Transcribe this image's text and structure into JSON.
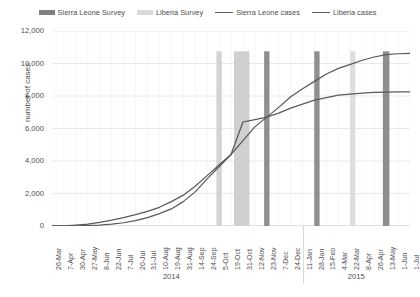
{
  "chart_data": {
    "type": "line",
    "title": "",
    "xlabel": "",
    "ylabel": "number of cases",
    "ylim": [
      0,
      12000
    ],
    "ytick_labels": [
      "12,000",
      "10,000",
      "8,000",
      "6,000",
      "4,000",
      "2,000",
      "0"
    ],
    "ytick_values": [
      12000,
      10000,
      8000,
      6000,
      4000,
      2000,
      0
    ],
    "grid": true,
    "legend_position": "top-center",
    "legend": [
      {
        "label": "Sierra Leone Survey",
        "type": "bar",
        "color": "#808080"
      },
      {
        "label": "Liberia Survey",
        "type": "bar",
        "color": "#d4d4d4"
      },
      {
        "label": "Sierra Leone cases",
        "type": "line",
        "color": "#595959"
      },
      {
        "label": "Liberia cases",
        "type": "line",
        "color": "#595959"
      }
    ],
    "categories": [
      "26-Mar",
      "7-Apr",
      "30-Apr",
      "27-May",
      "8-Jun",
      "22-Jun",
      "7-Jul",
      "20-Jul",
      "31-Jul",
      "10-Aug",
      "19-Aug",
      "31-Aug",
      "14-Sep",
      "24-Sep",
      "5-Oct",
      "19-Oct",
      "31-Oct",
      "12-Nov",
      "23-Nov",
      "7-Dec",
      "24-Dec",
      "11-Jan",
      "28-Jan",
      "15-Feb",
      "4-Mar",
      "22-Mar",
      "8-Apr",
      "26-Apr",
      "13-May",
      "1-Jun",
      "1-Jul"
    ],
    "x_groups": [
      {
        "label": "2014",
        "start_index": 0,
        "end_index": 20
      },
      {
        "label": "2015",
        "start_index": 21,
        "end_index": 30
      }
    ],
    "series": [
      {
        "name": "Sierra Leone cases",
        "color": "#595959",
        "values": [
          2,
          2,
          35,
          50,
          97,
          158,
          305,
          442,
          646,
          783,
          1026,
          1216,
          1620,
          2021,
          2789,
          3706,
          4759,
          5586,
          6317,
          7312,
          9446,
          10124,
          10518,
          11103,
          11466,
          11841,
          12201,
          12440,
          12632,
          12706,
          12839
        ],
        "display_values": [
          0,
          10,
          60,
          110,
          220,
          360,
          520,
          700,
          900,
          1150,
          1500,
          1900,
          2450,
          3100,
          3750,
          4400,
          5250,
          6100,
          6700,
          7300,
          7950,
          8450,
          8900,
          9350,
          9700,
          9950,
          10200,
          10400,
          10550,
          10600,
          10620
        ]
      },
      {
        "name": "Liberia cases",
        "color": "#595959",
        "values": [
          8,
          21,
          13,
          12,
          33,
          51,
          131,
          249,
          468,
          786,
          1082,
          1698,
          2407,
          3022,
          3924,
          4665,
          6535,
          7082,
          7168,
          7687,
          8018,
          8331,
          8622,
          8745,
          8881,
          9238,
          9343,
          9602,
          10042,
          10564,
          10672
        ],
        "display_values": [
          0,
          5,
          15,
          30,
          60,
          110,
          200,
          330,
          520,
          760,
          1050,
          1500,
          2100,
          2900,
          3650,
          4400,
          6400,
          6550,
          6700,
          6950,
          7250,
          7500,
          7750,
          7900,
          8050,
          8120,
          8180,
          8220,
          8240,
          8250,
          8250
        ]
      }
    ],
    "survey_bars": [
      {
        "series": "Liberia Survey",
        "color": "#d4d4d4",
        "center_index": 14.0,
        "width_indices": 0.45,
        "top_value": 10750
      },
      {
        "series": "Liberia Survey",
        "color": "#d0d0d0",
        "center_index": 15.9,
        "width_indices": 1.3,
        "top_value": 10750
      },
      {
        "series": "Sierra Leone Survey",
        "color": "#8f8f8f",
        "center_index": 18.0,
        "width_indices": 0.45,
        "top_value": 10750
      },
      {
        "series": "Sierra Leone Survey",
        "color": "#8f8f8f",
        "center_index": 22.2,
        "width_indices": 0.45,
        "top_value": 10750
      },
      {
        "series": "Liberia Survey",
        "color": "#dedede",
        "center_index": 25.2,
        "width_indices": 0.45,
        "top_value": 10750
      },
      {
        "series": "Sierra Leone Survey",
        "color": "#8f8f8f",
        "center_index": 28.0,
        "width_indices": 0.55,
        "top_value": 10750
      }
    ]
  }
}
